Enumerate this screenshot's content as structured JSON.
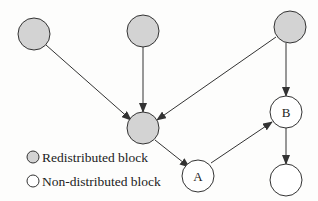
{
  "diagram": {
    "colors": {
      "redistributed_fill": "#d3d3d3",
      "non_distributed_fill": "#ffffff",
      "stroke": "#333333"
    },
    "nodes": [
      {
        "id": "top-left",
        "label": "",
        "type": "redistributed"
      },
      {
        "id": "top-middle",
        "label": "",
        "type": "redistributed"
      },
      {
        "id": "top-right",
        "label": "",
        "type": "redistributed"
      },
      {
        "id": "center",
        "label": "",
        "type": "redistributed"
      },
      {
        "id": "A",
        "label": "A",
        "type": "non-distributed"
      },
      {
        "id": "B",
        "label": "B",
        "type": "non-distributed"
      },
      {
        "id": "bottom-right",
        "label": "",
        "type": "non-distributed"
      }
    ],
    "edges": [
      {
        "from": "top-left",
        "to": "center"
      },
      {
        "from": "top-middle",
        "to": "center"
      },
      {
        "from": "top-right",
        "to": "center"
      },
      {
        "from": "top-right",
        "to": "B"
      },
      {
        "from": "center",
        "to": "A"
      },
      {
        "from": "A",
        "to": "B"
      },
      {
        "from": "B",
        "to": "bottom-right"
      }
    ]
  },
  "legend": {
    "redistributed_label": "Redistributed block",
    "non_distributed_label": "Non-distributed block"
  }
}
